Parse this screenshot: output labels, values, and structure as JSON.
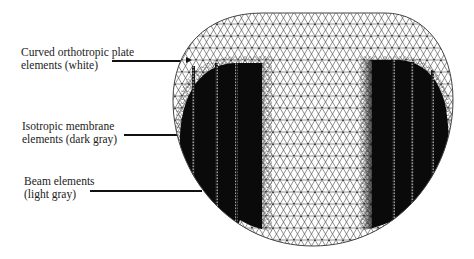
{
  "figure": {
    "labels": [
      {
        "line1": "Curved orthotropic plate",
        "line2": "elements (white)",
        "leader_y": 61
      },
      {
        "line1": "Isotropic membrane",
        "line2": "elements (dark gray)",
        "leader_y": 134
      },
      {
        "line1": "Beam elements",
        "line2": "(light gray)",
        "leader_y": 190
      }
    ],
    "colors": {
      "plate_elements": "#ffffff",
      "membrane_elements": "#0a0a0a",
      "mesh_lines": "#333333",
      "beam_stripes": "#8a8a8a"
    }
  }
}
